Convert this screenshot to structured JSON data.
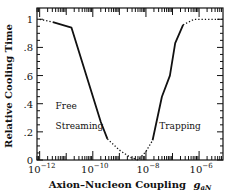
{
  "chart_data": {
    "type": "line",
    "title": "",
    "xlabel": "Axion–Nucleon Coupling g_aN",
    "xlabel_text": "Axion–Nucleon Coupling",
    "xlabel_symbol": "g",
    "xlabel_subscript": "aN",
    "ylabel": "Relative Cooling Time",
    "xscale": "log",
    "xlim_log10": [
      -12.1,
      -5.1
    ],
    "ylim": [
      0,
      1.08
    ],
    "x_ticks": [
      {
        "log10": -12,
        "label_base": "10",
        "label_exp": "−12"
      },
      {
        "log10": -10,
        "label_base": "10",
        "label_exp": "−10"
      },
      {
        "log10": -8,
        "label_base": "10",
        "label_exp": "−8"
      },
      {
        "log10": -6,
        "label_base": "10",
        "label_exp": "−6"
      }
    ],
    "y_ticks": [
      {
        "value": 0,
        "label": "0"
      },
      {
        "value": 0.2,
        "label": ".2"
      },
      {
        "value": 0.4,
        "label": ".4"
      },
      {
        "value": 0.6,
        "label": ".6"
      },
      {
        "value": 0.8,
        "label": ".8"
      },
      {
        "value": 1.0,
        "label": "1"
      }
    ],
    "grid": false,
    "legend": null,
    "series": [
      {
        "name": "free-streaming-dotted",
        "style": "dotted",
        "x_log10": [
          -12.0,
          -11.5
        ],
        "y": [
          1.0,
          0.98
        ]
      },
      {
        "name": "free-streaming-solid",
        "style": "solid",
        "x_log10": [
          -11.5,
          -10.8,
          -9.7,
          -9.45
        ],
        "y": [
          0.98,
          0.94,
          0.27,
          0.15
        ]
      },
      {
        "name": "minimum-dotted",
        "style": "dotted",
        "x_log10": [
          -9.45,
          -9.0,
          -8.6,
          -8.3,
          -8.0,
          -7.75
        ],
        "y": [
          0.15,
          0.07,
          0.02,
          0.0,
          0.06,
          0.14
        ]
      },
      {
        "name": "trapping-solid",
        "style": "solid",
        "x_log10": [
          -7.75,
          -7.4,
          -7.1,
          -6.9,
          -6.6
        ],
        "y": [
          0.14,
          0.45,
          0.6,
          0.83,
          0.96
        ]
      },
      {
        "name": "trapping-dotted",
        "style": "dotted",
        "x_log10": [
          -6.6,
          -6.2,
          -5.1
        ],
        "y": [
          0.96,
          1.0,
          1.0
        ]
      }
    ],
    "annotations": [
      {
        "text": "Free",
        "x_log10": -11.4,
        "y": 0.36
      },
      {
        "text": "Streaming",
        "x_log10": -11.4,
        "y": 0.22
      },
      {
        "text": "Trapping",
        "x_log10": -7.5,
        "y": 0.22
      }
    ]
  }
}
